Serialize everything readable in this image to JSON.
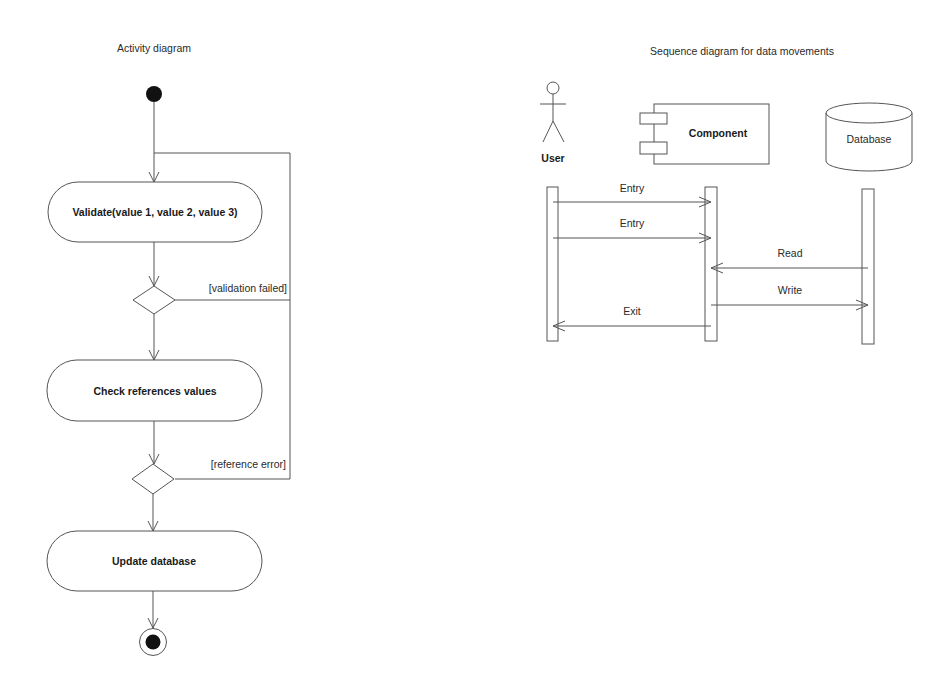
{
  "activity": {
    "title": "Activity diagram",
    "actions": [
      {
        "label": "Validate(value 1, value 2, value 3)"
      },
      {
        "label": "Check references values"
      },
      {
        "label": "Update database"
      }
    ],
    "guards": [
      {
        "label": "[validation failed]"
      },
      {
        "label": "[reference error]"
      }
    ]
  },
  "sequence": {
    "title": "Sequence diagram for data movements",
    "participants": [
      {
        "label": "User",
        "kind": "actor"
      },
      {
        "label": "Component",
        "kind": "component"
      },
      {
        "label": "Database",
        "kind": "database"
      }
    ],
    "messages": [
      {
        "label": "Entry",
        "from": "User",
        "to": "Component"
      },
      {
        "label": "Entry",
        "from": "User",
        "to": "Component"
      },
      {
        "label": "Read",
        "from": "Database",
        "to": "Component"
      },
      {
        "label": "Write",
        "from": "Component",
        "to": "Database"
      },
      {
        "label": "Exit",
        "from": "Component",
        "to": "User"
      }
    ]
  },
  "colors": {
    "line": "#555555",
    "text": "#1a1a1a",
    "background": "#ffffff"
  }
}
